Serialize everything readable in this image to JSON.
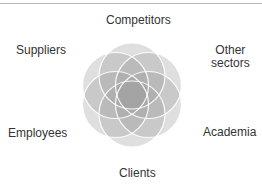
{
  "diagram": {
    "type": "overlapping-circles",
    "center_label": "",
    "stakeholders": [
      {
        "name": "Competitors",
        "lines": [
          "Competitors"
        ]
      },
      {
        "name": "Other sectors",
        "lines": [
          "Other",
          "sectors"
        ]
      },
      {
        "name": "Academia",
        "lines": [
          "Academia"
        ]
      },
      {
        "name": "Clients",
        "lines": [
          "Clients"
        ]
      },
      {
        "name": "Employees",
        "lines": [
          "Employees"
        ]
      },
      {
        "name": "Suppliers",
        "lines": [
          "Suppliers"
        ]
      }
    ],
    "colors": {
      "circle_fill": "#9a9a9a",
      "circle_stroke": "#ffffff",
      "text": "#333333",
      "top_rule": "#b8b8b8"
    }
  }
}
